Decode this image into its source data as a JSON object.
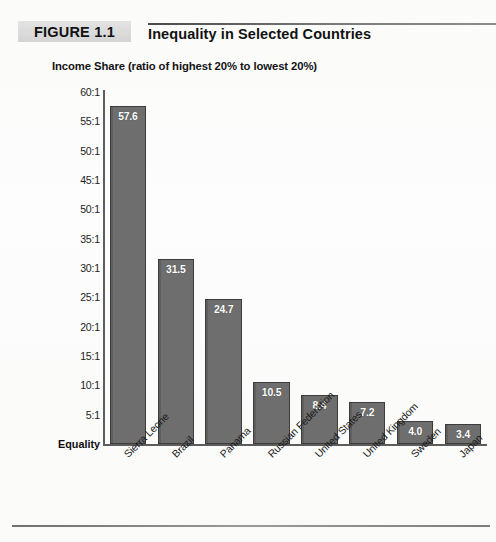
{
  "figure": {
    "tag": "FIGURE 1.1",
    "title": "Inequality in Selected Countries"
  },
  "chart_data": {
    "type": "bar",
    "title": "Inequality in Selected Countries",
    "subtitle": "Income Share (ratio of highest 20% to lowest 20%)",
    "xlabel": "",
    "ylabel": "Income Share (ratio of highest 20% to lowest 20%)",
    "ylim": [
      0,
      60
    ],
    "grid": false,
    "legend": "none",
    "baseline_label": "Equality",
    "ytick_labels": [
      "60:1",
      "55:1",
      "50:1",
      "45:1",
      "50:1",
      "35:1",
      "30:1",
      "25:1",
      "20:1",
      "15:1",
      "10:1",
      "5:1"
    ],
    "ytick_values": [
      60,
      55,
      50,
      45,
      40,
      35,
      30,
      25,
      20,
      15,
      10,
      5
    ],
    "categories": [
      "Sierra Leone",
      "Brazil",
      "Panama",
      "Russian Federation",
      "United States",
      "United Kingdom",
      "Sweden",
      "Japan"
    ],
    "values": [
      57.6,
      31.5,
      24.7,
      10.5,
      8.4,
      7.2,
      4.0,
      3.4
    ],
    "value_labels": [
      "57.6",
      "31.5",
      "24.7",
      "10.5",
      "8.4",
      "7.2",
      "4.0",
      "3.4"
    ],
    "bar_color": "#6e6e6e",
    "bar_edge_color": "#3c3c3c",
    "value_label_color": "#ffffff",
    "axis_color": "#5d5d5d"
  }
}
